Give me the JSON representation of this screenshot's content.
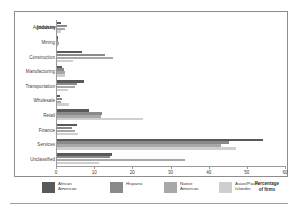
{
  "chart_data": {
    "type": "bar",
    "orientation": "horizontal",
    "title": "",
    "xlabel": "Percentage\nof firms",
    "ylabel": "Industry",
    "xlim": [
      0,
      60
    ],
    "xticks": [
      0,
      10,
      20,
      30,
      40,
      50,
      60
    ],
    "xtick_labels": [
      "0",
      "10",
      "20",
      "30",
      "40",
      "50",
      "60"
    ],
    "grid": false,
    "legend_position": "bottom",
    "categories": [
      "Agriculture",
      "Mining",
      "Construction",
      "Manufacturing",
      "Transportation",
      "Wholesale",
      "Retail",
      "Finance",
      "Services",
      "Unclassified"
    ],
    "series": [
      {
        "name": "African\nAmerican",
        "legend_label": "African American",
        "color": "#595959",
        "values": [
          1.0,
          0.3,
          6.6,
          1.2,
          7.0,
          0.9,
          8.4,
          5.2,
          54.0,
          14.5
        ]
      },
      {
        "name": "Hispanic",
        "legend_label": "Hispanic",
        "color": "#8a8a8a",
        "values": [
          2.6,
          0.3,
          12.6,
          1.9,
          5.2,
          1.3,
          11.8,
          4.0,
          45.0,
          14.0
        ]
      },
      {
        "name": "Native\nAmerican",
        "legend_label": "Native American",
        "color": "#a8a8a8",
        "values": [
          2.1,
          0.5,
          14.6,
          2.0,
          4.6,
          1.1,
          11.4,
          4.6,
          43.0,
          33.5
        ]
      },
      {
        "name": "Asian/Pacific\nIslander",
        "legend_label": "Asian/Pacific Islander",
        "color": "#cfcfcf",
        "values": [
          1.0,
          0.2,
          4.1,
          2.2,
          2.8,
          3.1,
          22.5,
          5.6,
          47.0,
          11.0
        ]
      }
    ]
  },
  "legend": {
    "items": [
      {
        "label": "African\nAmerican",
        "color": "#595959"
      },
      {
        "label": "Hispanic",
        "color": "#8a8a8a"
      },
      {
        "label": "Native\nAmerican",
        "color": "#a8a8a8"
      },
      {
        "label": "Asian/Pacific\nIslander",
        "color": "#cfcfcf"
      }
    ]
  },
  "axis_caption": "Percentage\nof firms"
}
